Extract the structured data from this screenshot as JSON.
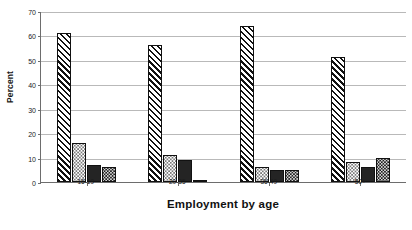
{
  "chart_data": {
    "type": "bar",
    "title": "",
    "xlabel": "Employment by age",
    "ylabel": "Percent",
    "categories": [
      "16-19",
      "20-35",
      "36-49",
      "50+"
    ],
    "series": [
      {
        "name": "series-1",
        "pattern": "diagonal-hatch",
        "values": [
          61,
          56,
          64,
          51
        ]
      },
      {
        "name": "series-2",
        "pattern": "light-dotted",
        "values": [
          16,
          11,
          6,
          8
        ]
      },
      {
        "name": "series-3",
        "pattern": "solid-dark",
        "values": [
          7,
          9,
          5,
          6
        ]
      },
      {
        "name": "series-4",
        "pattern": "dark-checker",
        "values": [
          6,
          1,
          5,
          10
        ]
      }
    ],
    "ylim": [
      0,
      70
    ],
    "yticks": [
      0,
      10,
      20,
      30,
      40,
      50,
      60,
      70
    ],
    "ytick_labels": [
      "0",
      "10",
      "20",
      "30",
      "40",
      "50",
      "60",
      "70"
    ],
    "grid": true,
    "legend": "none"
  }
}
